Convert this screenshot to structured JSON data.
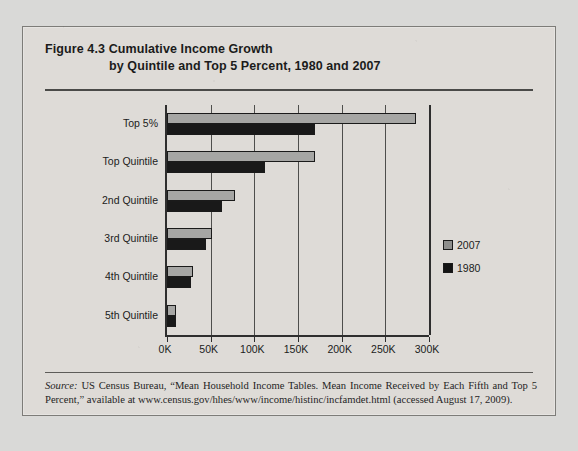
{
  "figure": {
    "label": "Figure 4.3",
    "title_line1": "Cumulative Income Growth",
    "title_line2": "by Quintile and Top 5 Percent, 1980 and 2007",
    "source_prefix": "Source:",
    "source_text": " US Census Bureau, “Mean Household Income Tables. Mean Income Received by Each Fifth and Top 5 Percent,” available at www.census.gov/hhes/www/income/histinc/incfamdet.html (accessed August 17, 2009)."
  },
  "chart_data": {
    "type": "bar",
    "orientation": "horizontal",
    "title": "Figure 4.3 Cumulative Income Growth by Quintile and Top 5 Percent, 1980 and 2007",
    "xlabel": "",
    "ylabel": "",
    "categories": [
      "Top 5%",
      "Top Quintile",
      "2nd Quintile",
      "3rd Quintile",
      "4th Quintile",
      "5th Quintile"
    ],
    "series": [
      {
        "name": "2007",
        "color": "#a6a6a4",
        "values": [
          285000,
          169000,
          78000,
          51000,
          30000,
          10000
        ]
      },
      {
        "name": "1980",
        "color": "#191919",
        "values": [
          169000,
          112000,
          63000,
          45000,
          27000,
          10000
        ]
      }
    ],
    "xlim": [
      0,
      300000
    ],
    "xticks": [
      0,
      50000,
      100000,
      150000,
      200000,
      250000,
      300000
    ],
    "xticklabels": [
      "0K",
      "50K",
      "100K",
      "150K",
      "200K",
      "250K",
      "300K"
    ],
    "grid": true,
    "grid_axis": "x",
    "legend_position": "right"
  }
}
